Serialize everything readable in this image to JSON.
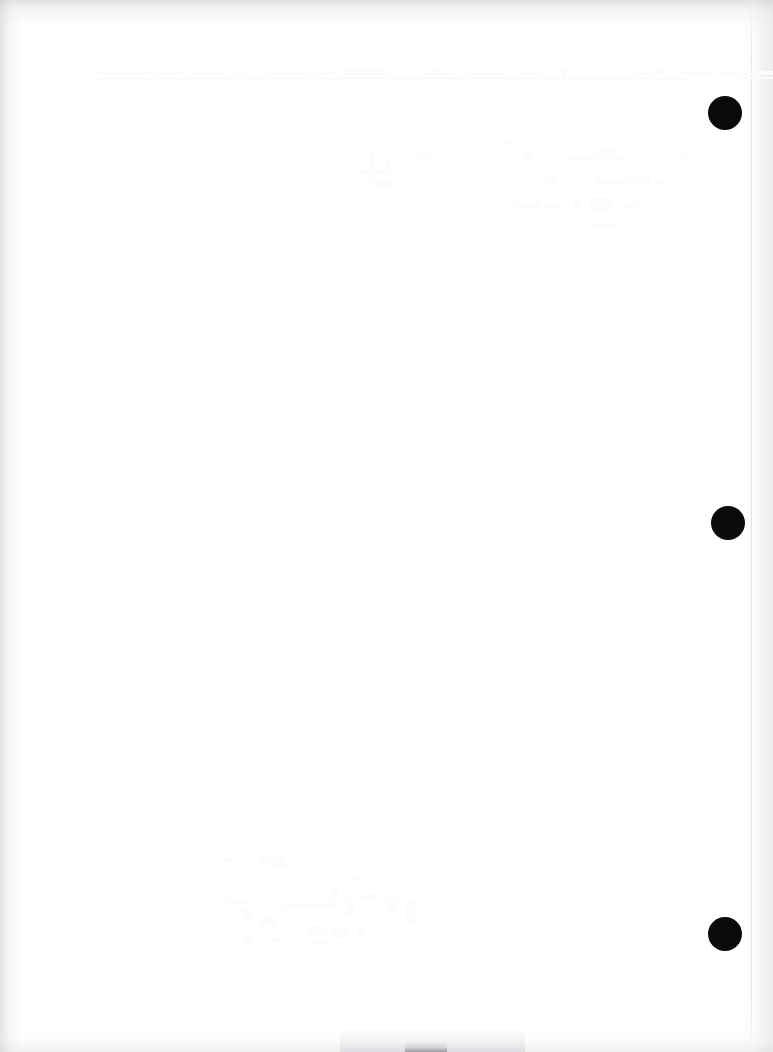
{
  "document": {
    "kind": "scanned-page",
    "title": "Scanned blank document page",
    "page_width": 773,
    "page_height": 1052,
    "background_color": "#ffffff",
    "orientation": "portrait",
    "content_text": "",
    "visible_text_legible": false,
    "notes_label": "No legible text content on page"
  },
  "binding": {
    "label": "Three-hole punch margin",
    "edge": "right",
    "hole_color": "#0a0a0a",
    "holes": [
      {
        "name": "punch-hole-top",
        "cx": 725,
        "cy": 113,
        "r": 17
      },
      {
        "name": "punch-hole-middle",
        "cx": 728,
        "cy": 523,
        "r": 17
      },
      {
        "name": "punch-hole-bottom",
        "cx": 725,
        "cy": 934,
        "r": 17
      }
    ]
  },
  "scan_artifacts": {
    "label": "Scanner shading and edge artifacts",
    "edge_shadow_color": "#c4c6c9",
    "sheet_rule_color": "#cdcfd2",
    "smudge_color": "#96989c",
    "smudge": {
      "x": 405,
      "y": 1042,
      "width": 42,
      "height": 10
    },
    "smudge_halo": {
      "x": 340,
      "y": 1028,
      "width": 185,
      "height": 24
    }
  },
  "residual_ink": {
    "label": "Faint bleached ink traces",
    "color": "#fafbfc",
    "regions": [
      {
        "name": "trace-region-top-band",
        "x": 95,
        "y": 68,
        "width": 600,
        "height": 14
      },
      {
        "name": "trace-region-upper-right",
        "x": 500,
        "y": 140,
        "width": 180,
        "height": 90
      },
      {
        "name": "trace-region-center",
        "x": 360,
        "y": 150,
        "width": 90,
        "height": 60
      },
      {
        "name": "trace-region-lower-mid",
        "x": 200,
        "y": 840,
        "width": 250,
        "height": 120
      },
      {
        "name": "trace-region-faint-frame",
        "x": 95,
        "y": 78,
        "width": 590,
        "height": 80
      }
    ]
  }
}
